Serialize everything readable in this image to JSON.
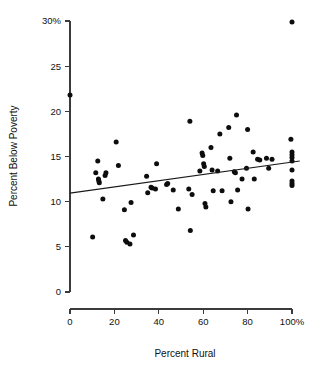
{
  "chart_data": {
    "type": "scatter",
    "title": "",
    "xlabel": "Percent Rural",
    "ylabel": "Percent Below Poverty",
    "xlim": [
      0,
      100
    ],
    "ylim": [
      0,
      30
    ],
    "grid": false,
    "legend": "none",
    "x_ticks": [
      0,
      20,
      40,
      60,
      80,
      100
    ],
    "x_tick_labels": [
      "0",
      "20",
      "40",
      "60",
      "80",
      "100%"
    ],
    "y_ticks": [
      0,
      5,
      10,
      15,
      20,
      25,
      30
    ],
    "y_tick_labels": [
      "0",
      "5",
      "10",
      "15",
      "20",
      "25",
      "30%"
    ],
    "point_color": "#0d0d0d",
    "line_color": "#1a1a1a",
    "trendline": {
      "name": "least-squares fit",
      "x_start": 0,
      "y_start": 10.95,
      "x_end": 103.5,
      "y_end": 14.5,
      "slope": 0.0343,
      "intercept": 10.95
    },
    "points": [
      {
        "x": 0.0,
        "y": 21.8
      },
      {
        "x": 10.2,
        "y": 6.1
      },
      {
        "x": 11.6,
        "y": 13.2
      },
      {
        "x": 12.5,
        "y": 14.5
      },
      {
        "x": 12.8,
        "y": 12.5
      },
      {
        "x": 13.0,
        "y": 12.3
      },
      {
        "x": 13.2,
        "y": 12.1
      },
      {
        "x": 14.8,
        "y": 10.3
      },
      {
        "x": 15.8,
        "y": 12.9
      },
      {
        "x": 16.2,
        "y": 13.2
      },
      {
        "x": 20.8,
        "y": 16.6
      },
      {
        "x": 21.8,
        "y": 14.0
      },
      {
        "x": 24.5,
        "y": 9.1
      },
      {
        "x": 25.0,
        "y": 5.7
      },
      {
        "x": 25.6,
        "y": 5.5
      },
      {
        "x": 27.0,
        "y": 5.3
      },
      {
        "x": 27.5,
        "y": 9.9
      },
      {
        "x": 28.6,
        "y": 6.3
      },
      {
        "x": 34.5,
        "y": 12.8
      },
      {
        "x": 35.0,
        "y": 11.0
      },
      {
        "x": 36.5,
        "y": 11.6
      },
      {
        "x": 37.0,
        "y": 11.5
      },
      {
        "x": 38.5,
        "y": 11.4
      },
      {
        "x": 39.0,
        "y": 14.2
      },
      {
        "x": 43.5,
        "y": 11.9
      },
      {
        "x": 44.0,
        "y": 12.0
      },
      {
        "x": 46.5,
        "y": 11.3
      },
      {
        "x": 48.8,
        "y": 9.2
      },
      {
        "x": 53.5,
        "y": 11.4
      },
      {
        "x": 54.0,
        "y": 18.9
      },
      {
        "x": 54.2,
        "y": 6.8
      },
      {
        "x": 55.0,
        "y": 10.8
      },
      {
        "x": 58.5,
        "y": 13.4
      },
      {
        "x": 59.5,
        "y": 15.4
      },
      {
        "x": 59.8,
        "y": 15.1
      },
      {
        "x": 60.2,
        "y": 14.2
      },
      {
        "x": 60.5,
        "y": 13.9
      },
      {
        "x": 60.8,
        "y": 9.8
      },
      {
        "x": 61.2,
        "y": 9.4
      },
      {
        "x": 63.5,
        "y": 16.0
      },
      {
        "x": 64.0,
        "y": 13.5
      },
      {
        "x": 64.5,
        "y": 11.2
      },
      {
        "x": 66.5,
        "y": 13.4
      },
      {
        "x": 67.5,
        "y": 17.5
      },
      {
        "x": 68.5,
        "y": 11.2
      },
      {
        "x": 71.5,
        "y": 18.2
      },
      {
        "x": 72.0,
        "y": 14.8
      },
      {
        "x": 72.5,
        "y": 10.0
      },
      {
        "x": 74.0,
        "y": 13.3
      },
      {
        "x": 74.5,
        "y": 13.2
      },
      {
        "x": 75.0,
        "y": 19.6
      },
      {
        "x": 75.5,
        "y": 11.3
      },
      {
        "x": 77.5,
        "y": 12.5
      },
      {
        "x": 79.5,
        "y": 13.7
      },
      {
        "x": 80.0,
        "y": 18.0
      },
      {
        "x": 80.2,
        "y": 9.2
      },
      {
        "x": 82.5,
        "y": 15.5
      },
      {
        "x": 83.0,
        "y": 12.5
      },
      {
        "x": 84.5,
        "y": 14.7
      },
      {
        "x": 85.5,
        "y": 14.6
      },
      {
        "x": 88.5,
        "y": 14.8
      },
      {
        "x": 89.5,
        "y": 13.7
      },
      {
        "x": 91.0,
        "y": 14.7
      },
      {
        "x": 99.5,
        "y": 16.9
      },
      {
        "x": 100.0,
        "y": 15.5
      },
      {
        "x": 100.0,
        "y": 15.2
      },
      {
        "x": 100.0,
        "y": 14.9
      },
      {
        "x": 100.0,
        "y": 14.5
      },
      {
        "x": 100.0,
        "y": 13.5
      },
      {
        "x": 100.0,
        "y": 12.3
      },
      {
        "x": 100.0,
        "y": 12.0
      },
      {
        "x": 100.0,
        "y": 11.8
      },
      {
        "x": 100.0,
        "y": 29.9
      }
    ]
  },
  "axes": {
    "x_title": "Percent Rural",
    "y_title": "Percent Below Poverty"
  }
}
